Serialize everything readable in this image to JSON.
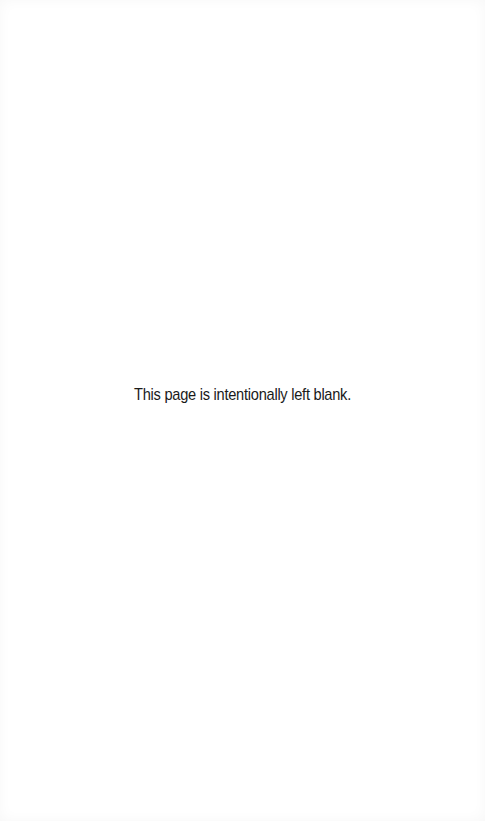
{
  "page": {
    "notice": "This page is intentionally left blank."
  }
}
